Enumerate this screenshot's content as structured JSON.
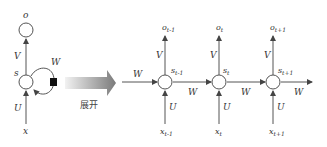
{
  "diagram": {
    "folded": {
      "output": "o",
      "state": "s",
      "input": "x",
      "weights": {
        "input": "U",
        "output": "V",
        "recurrent": "W"
      }
    },
    "unfold_label": "展开",
    "unfolded": [
      {
        "output": "o",
        "output_sub": "t-1",
        "state": "s",
        "state_sub": "t-1",
        "input": "x",
        "input_sub": "t-1",
        "U": "U",
        "V": "V",
        "W_out": "W"
      },
      {
        "output": "o",
        "output_sub": "t",
        "state": "s",
        "state_sub": "t",
        "input": "x",
        "input_sub": "t",
        "U": "U",
        "V": "V",
        "W_out": "W"
      },
      {
        "output": "o",
        "output_sub": "t+1",
        "state": "s",
        "state_sub": "t+1",
        "input": "x",
        "input_sub": "t+1",
        "U": "U",
        "V": "V",
        "W_out": "W"
      }
    ],
    "incoming_W": "W",
    "colors": {
      "stroke": "#555555",
      "arrow_gradient_start": "#f0f0f0",
      "arrow_gradient_end": "#808080",
      "box": "#111111"
    }
  }
}
